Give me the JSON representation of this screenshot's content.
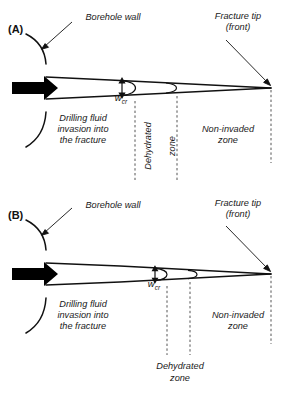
{
  "figure": {
    "type": "schematic-diagram",
    "background_color": "#ffffff",
    "line_color": "#111111",
    "arrow_fill": "#000000"
  },
  "panels": [
    {
      "id": "A",
      "tag": "(A)",
      "labels": {
        "borehole_wall": "Borehole wall",
        "fracture_tip_line1": "Fracture tip",
        "fracture_tip_line2": "(front)",
        "invasion": "Drilling fluid\ninvasion into\nthe fracture",
        "dehydrated_line1": "Dehydrated",
        "dehydrated_line2": "zone",
        "dehydrated_orientation": "vertical",
        "non_invaded": "Non-invaded\nzone",
        "width_symbol": "w",
        "width_subscript": "cr"
      }
    },
    {
      "id": "B",
      "tag": "(B)",
      "labels": {
        "borehole_wall": "Borehole wall",
        "fracture_tip_line1": "Fracture tip",
        "fracture_tip_line2": "(front)",
        "invasion": "Drilling fluid\ninvasion into\nthe fracture",
        "dehydrated_line1": "Dehydrated",
        "dehydrated_line2": "zone",
        "dehydrated_orientation": "horizontal",
        "non_invaded": "Non-invaded\nzone",
        "width_symbol": "w",
        "width_subscript": "cr"
      }
    }
  ],
  "chart_data": {
    "type": "diagram",
    "panel_A": {
      "fracture_mouth_half_aperture_px": 11,
      "fracture_tip_x_px": 271,
      "fracture_mouth_x_px": 46,
      "centerline_y_px": 88,
      "wcr_marker_x_px": 122,
      "dehydrated_zone_left_x_px": 135,
      "dehydrated_zone_right_x_px": 177,
      "tip_dashed_x_px": 271
    },
    "panel_B": {
      "fracture_mouth_half_aperture_px": 11,
      "fracture_tip_x_px": 271,
      "fracture_mouth_x_px": 46,
      "centerline_y_px": 262,
      "wcr_marker_x_px": 155,
      "dehydrated_zone_left_x_px": 167,
      "dehydrated_zone_right_x_px": 190,
      "tip_dashed_x_px": 271
    }
  }
}
